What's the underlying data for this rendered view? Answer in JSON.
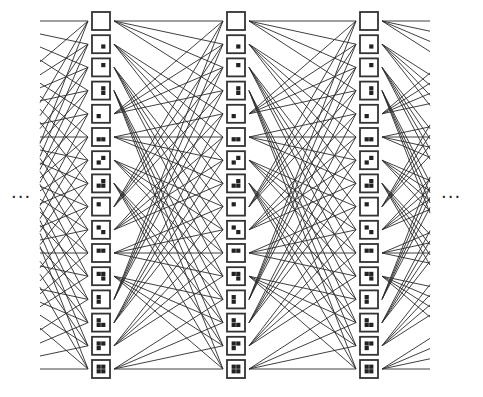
{
  "diagram": {
    "title": "",
    "ellipsis_left": "···",
    "ellipsis_right": "···",
    "colors": {
      "line": "#2a2a2a",
      "box_border": "#333333",
      "cell_fill": "#222222",
      "background": "#ffffff"
    },
    "layout": {
      "columns_x": [
        92,
        227,
        360
      ],
      "box_size": 18,
      "first_box_y": 12,
      "box_pitch": 23.2,
      "left_stub_x": 40,
      "right_stub_x": 430
    },
    "bit_cells": {
      "1": "bottom-right",
      "2": "top-right",
      "4": "bottom-left",
      "8": "top-left"
    },
    "states": [
      {
        "id": 0,
        "cells": []
      },
      {
        "id": 1,
        "cells": [
          "bottom-right"
        ]
      },
      {
        "id": 2,
        "cells": [
          "top-right"
        ]
      },
      {
        "id": 3,
        "cells": [
          "top-right",
          "bottom-right"
        ]
      },
      {
        "id": 4,
        "cells": [
          "bottom-left"
        ]
      },
      {
        "id": 5,
        "cells": [
          "bottom-left",
          "bottom-right"
        ]
      },
      {
        "id": 6,
        "cells": [
          "top-right",
          "bottom-left"
        ]
      },
      {
        "id": 7,
        "cells": [
          "top-right",
          "bottom-left",
          "bottom-right"
        ]
      },
      {
        "id": 8,
        "cells": [
          "top-left"
        ]
      },
      {
        "id": 9,
        "cells": [
          "top-left",
          "bottom-right"
        ]
      },
      {
        "id": 10,
        "cells": [
          "top-left",
          "top-right"
        ]
      },
      {
        "id": 11,
        "cells": [
          "top-left",
          "top-right",
          "bottom-right"
        ]
      },
      {
        "id": 12,
        "cells": [
          "top-left",
          "bottom-left"
        ]
      },
      {
        "id": 13,
        "cells": [
          "top-left",
          "bottom-left",
          "bottom-right"
        ]
      },
      {
        "id": 14,
        "cells": [
          "top-left",
          "top-right",
          "bottom-left"
        ]
      },
      {
        "id": 15,
        "cells": [
          "top-left",
          "top-right",
          "bottom-left",
          "bottom-right"
        ]
      }
    ],
    "transition_rule": "state i connects to states (4*i mod 16) + k for k in 0..3"
  }
}
